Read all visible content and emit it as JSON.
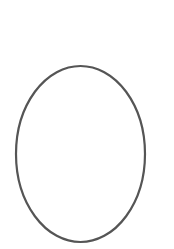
{
  "drawing": {
    "shape": "ellipse",
    "stroke_color": "#555555",
    "fill_color": "none",
    "background_color": "#ffffff"
  }
}
